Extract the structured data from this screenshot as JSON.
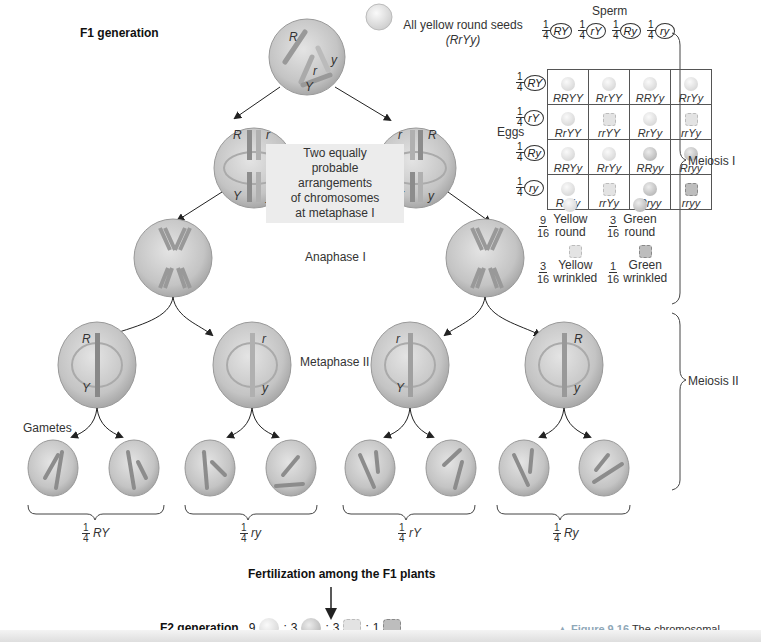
{
  "title": "F1 generation",
  "f1_seed_label": "All yellow round seeds",
  "f1_genotype": "(RrYy)",
  "metaphase1_note": [
    "Two equally",
    "probable",
    "arrangements",
    "of chromosomes",
    "at metaphase I"
  ],
  "stage_labels": {
    "anaphase1": "Anaphase I",
    "metaphase2": "Metaphase II",
    "gametes": "Gametes"
  },
  "meiosis_labels": {
    "meiosis1": "Meiosis I",
    "meiosis2": "Meiosis II"
  },
  "metaphase1_cells": [
    {
      "top_left": "R",
      "top_right": "r",
      "bottom_left": "Y",
      "bottom_right": "y"
    },
    {
      "top_left": "r",
      "top_right": "R",
      "bottom_left": "Y",
      "bottom_right": "y"
    }
  ],
  "metaphase2_cells": [
    {
      "top": "R",
      "bottom": "Y"
    },
    {
      "top": "r",
      "bottom": "y"
    },
    {
      "top": "r",
      "bottom": "Y"
    },
    {
      "top": "R",
      "bottom": "y"
    }
  ],
  "gamete_groups": [
    {
      "fraction": "1/4",
      "genotype": "RY",
      "alleles": [
        [
          "Y",
          "R"
        ],
        [
          "R",
          "Y"
        ]
      ]
    },
    {
      "fraction": "1/4",
      "genotype": "ry",
      "alleles": [
        [
          "y",
          "r"
        ],
        [
          "y",
          "r"
        ]
      ]
    },
    {
      "fraction": "1/4",
      "genotype": "rY",
      "alleles": [
        [
          "Y",
          "r"
        ],
        [
          "Y",
          "r"
        ]
      ]
    },
    {
      "fraction": "1/4",
      "genotype": "Ry",
      "alleles": [
        [
          "R",
          "y"
        ],
        [
          "y",
          "R"
        ]
      ]
    }
  ],
  "fertilization_label": "Fertilization among the F1 plants",
  "f2": {
    "label": "F2 generation",
    "ratio": [
      {
        "count": "9",
        "phenotype": "yellow-round"
      },
      {
        "count": "3",
        "phenotype": "green-round"
      },
      {
        "count": "3",
        "phenotype": "yellow-wrinkled"
      },
      {
        "count": "1",
        "phenotype": "green-wrinkled"
      }
    ]
  },
  "punnett": {
    "sperm_label": "Sperm",
    "eggs_label": "Eggs",
    "fraction": {
      "num": "1",
      "den": "4"
    },
    "sperm": [
      "RY",
      "rY",
      "Ry",
      "ry"
    ],
    "eggs": [
      "RY",
      "rY",
      "Ry",
      "ry"
    ],
    "cells": [
      [
        {
          "g": "RRYY",
          "p": "yr"
        },
        {
          "g": "RrYY",
          "p": "yr"
        },
        {
          "g": "RRYy",
          "p": "yr"
        },
        {
          "g": "RrYy",
          "p": "yr"
        }
      ],
      [
        {
          "g": "RrYY",
          "p": "yr"
        },
        {
          "g": "rrYY",
          "p": "yw"
        },
        {
          "g": "RrYy",
          "p": "yr"
        },
        {
          "g": "rrYy",
          "p": "yw"
        }
      ],
      [
        {
          "g": "RRYy",
          "p": "yr"
        },
        {
          "g": "RrYy",
          "p": "yr"
        },
        {
          "g": "RRyy",
          "p": "gr"
        },
        {
          "g": "Rryy",
          "p": "gr"
        }
      ],
      [
        {
          "g": "RrYy",
          "p": "yr"
        },
        {
          "g": "rrYy",
          "p": "yw"
        },
        {
          "g": "Rryy",
          "p": "gr"
        },
        {
          "g": "rryy",
          "p": "gw"
        }
      ]
    ],
    "legend": [
      {
        "num": "9",
        "den": "16",
        "line1": "Yellow",
        "line2": "round"
      },
      {
        "num": "3",
        "den": "16",
        "line1": "Green",
        "line2": "round"
      },
      {
        "num": "3",
        "den": "16",
        "line1": "Yellow",
        "line2": "wrinkled"
      },
      {
        "num": "1",
        "den": "16",
        "line1": "Green",
        "line2": "wrinkled"
      }
    ]
  },
  "caption": {
    "figure": "▲ Figure 9.16",
    "text": "The chromosomal",
    "text2": "basis of Mendel's laws"
  },
  "colors": {
    "cell": "#c9c9c9",
    "cell_edge": "#9a9a9a",
    "yellow_seed": "#ececec",
    "green_seed": "#cfcfcf",
    "caption_accent": "#8fa8b8"
  }
}
